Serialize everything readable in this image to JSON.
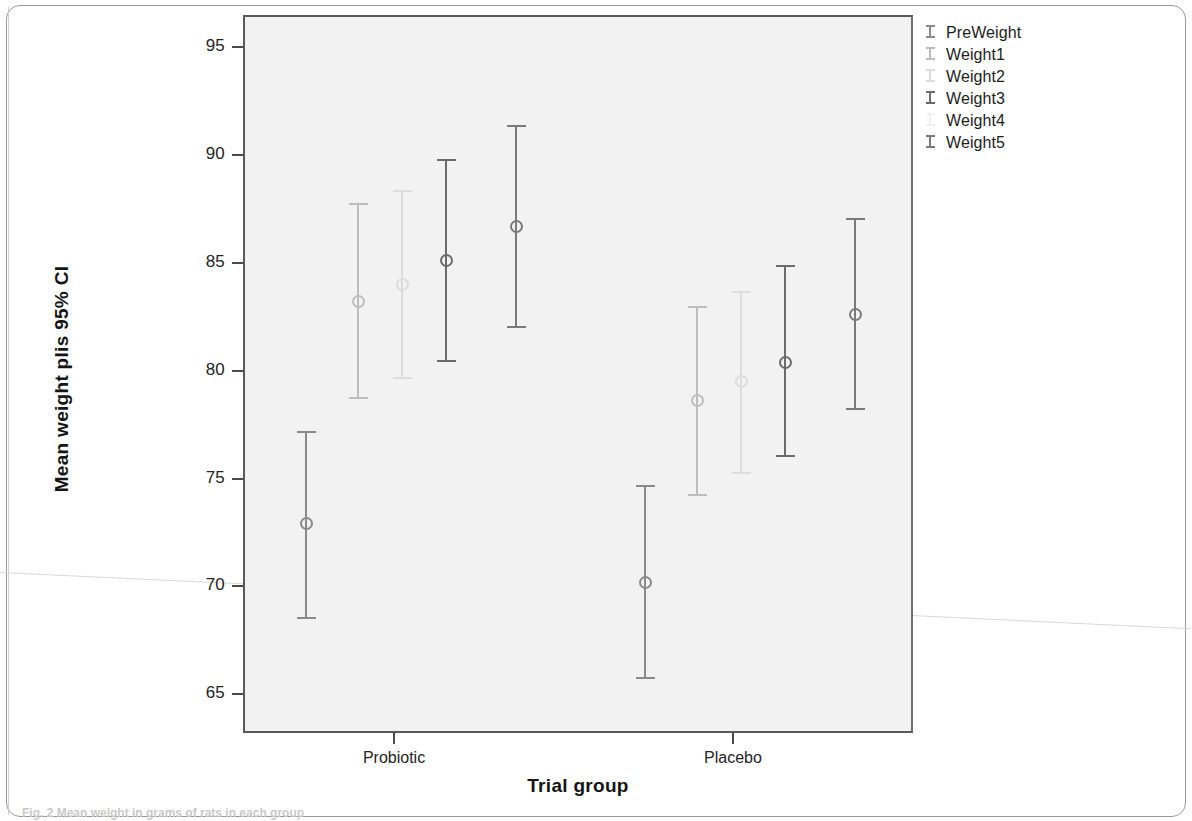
{
  "chart_data": {
    "type": "scatter",
    "title": "",
    "xlabel": "Trial group",
    "ylabel": "Mean weight plis 95% CI",
    "ylim": [
      63.2,
      96.5
    ],
    "yticks": [
      65,
      70,
      75,
      80,
      85,
      90,
      95
    ],
    "ytick_labels": [
      "65",
      "70",
      "75",
      "80",
      "85",
      "90",
      "95"
    ],
    "categories": [
      "Probiotic",
      "Placebo"
    ],
    "grid": false,
    "legend_position": "outside-right-top",
    "series": [
      {
        "name": "PreWeight",
        "color": "#8a8a8a",
        "values": [
          72.9,
          70.2
        ],
        "ci_low": [
          68.5,
          65.7
        ],
        "ci_high": [
          77.2,
          74.7
        ]
      },
      {
        "name": "Weight1",
        "color": "#bdbdbd",
        "values": [
          83.2,
          78.6
        ],
        "ci_low": [
          78.7,
          74.2
        ],
        "ci_high": [
          87.8,
          83.0
        ]
      },
      {
        "name": "Weight2",
        "color": "#dcdcdc",
        "values": [
          84.0,
          79.5
        ],
        "ci_low": [
          79.6,
          75.2
        ],
        "ci_high": [
          88.4,
          83.7
        ]
      },
      {
        "name": "Weight3",
        "color": "#6b6b6b",
        "values": [
          85.1,
          80.4
        ],
        "ci_low": [
          80.4,
          76.0
        ],
        "ci_high": [
          89.8,
          84.9
        ]
      },
      {
        "name": "Weight4",
        "color": "#e8e8e8",
        "values": [
          null,
          null
        ],
        "ci_low": [
          null,
          null
        ],
        "ci_high": [
          null,
          null
        ]
      },
      {
        "name": "Weight5",
        "color": "#7a7a7a",
        "values": [
          86.7,
          82.6
        ],
        "ci_low": [
          82.0,
          78.2
        ],
        "ci_high": [
          91.4,
          87.1
        ]
      }
    ]
  },
  "axis": {
    "y_title": "Mean weight plis 95% CI",
    "x_title": "Trial group",
    "y_tick_labels": [
      "95",
      "90",
      "85",
      "80",
      "75",
      "70",
      "65"
    ],
    "x_tick_labels": [
      "Probiotic",
      "Placebo"
    ]
  },
  "legend": {
    "items": [
      {
        "label": "PreWeight",
        "color": "#8a8a8a",
        "icon": "error-bar-icon"
      },
      {
        "label": "Weight1",
        "color": "#bdbdbd",
        "icon": "error-bar-icon"
      },
      {
        "label": "Weight2",
        "color": "#dcdcdc",
        "icon": "error-bar-icon"
      },
      {
        "label": "Weight3",
        "color": "#6b6b6b",
        "icon": "error-bar-icon"
      },
      {
        "label": "Weight4",
        "color": "#f0f0f0",
        "icon": "error-bar-icon"
      },
      {
        "label": "Weight5",
        "color": "#7a7a7a",
        "icon": "error-bar-icon"
      }
    ]
  },
  "caption": {
    "text": "Fig. 2 Mean weight in grams of rats in each group"
  }
}
